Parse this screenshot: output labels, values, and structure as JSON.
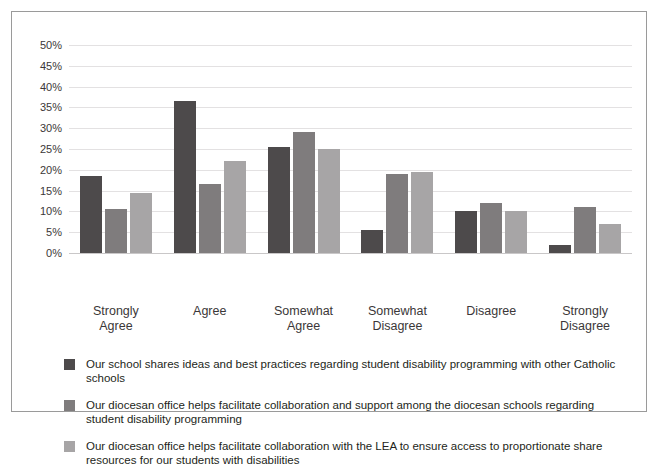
{
  "title_sliver": "",
  "chart_data": {
    "type": "bar",
    "title": "",
    "subtitle": "",
    "xlabel": "",
    "ylabel": "",
    "ylim": [
      0,
      50
    ],
    "ytick_step": 5,
    "grid": true,
    "legend_position": "bottom-left",
    "categories": [
      "Strongly\nAgree",
      "Agree",
      "Somewhat\nAgree",
      "Somewhat\nDisagree",
      "Disagree",
      "Strongly\nDisagree"
    ],
    "ytick_labels": [
      "50%",
      "45%",
      "40%",
      "35%",
      "30%",
      "25%",
      "20%",
      "15%",
      "10%",
      "5%",
      "0%"
    ],
    "series": [
      {
        "name": "Our school shares ideas and best practices regarding student disability programming with other Catholic schools",
        "color": "#4d4a4b",
        "values": [
          18.5,
          36.5,
          25.5,
          5.5,
          10.0,
          2.0
        ]
      },
      {
        "name": "Our diocesan office helps facilitate collaboration and support among the diocesan schools regarding student disability programming",
        "color": "#7f7c7d",
        "values": [
          10.5,
          16.5,
          29.0,
          19.0,
          12.0,
          11.0
        ]
      },
      {
        "name": "Our diocesan office helps facilitate collaboration with the LEA to ensure access to proportionate share resources for our students with disabilities",
        "color": "#a7a5a6",
        "values": [
          14.5,
          22.0,
          25.0,
          19.5,
          10.0,
          7.0
        ]
      }
    ]
  }
}
